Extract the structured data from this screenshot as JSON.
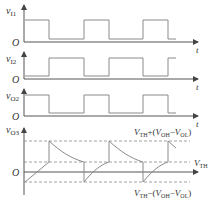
{
  "diagram": {
    "title": "",
    "panels": [
      {
        "id": "vI1",
        "var": "v",
        "sub": "I1",
        "origin": "O",
        "time_label": "t"
      },
      {
        "id": "vI2",
        "var": "v",
        "sub": "I2",
        "origin": "O",
        "time_label": "t"
      },
      {
        "id": "vO2",
        "var": "v",
        "sub": "O2",
        "origin": "O",
        "time_label": "t"
      },
      {
        "id": "vO3",
        "var": "v",
        "sub": "O3",
        "origin": "O",
        "time_label": ""
      }
    ],
    "levels": {
      "upper": {
        "v1": "V",
        "s1": "TH",
        "op": "+",
        "open": "(",
        "v2": "V",
        "s2": "OH",
        "minus": "−",
        "v3": "V",
        "s3": "OL",
        "close": ")"
      },
      "mid": {
        "v": "V",
        "s": "TH"
      },
      "lower": {
        "v1": "V",
        "s1": "TH",
        "op": "−",
        "open": "(",
        "v2": "V",
        "s2": "OH",
        "minus": "−",
        "v3": "V",
        "s3": "OL",
        "close": ")"
      }
    },
    "colors": {
      "wave": "#8a8a8a",
      "axis": "#555555",
      "text": "#333333"
    }
  }
}
